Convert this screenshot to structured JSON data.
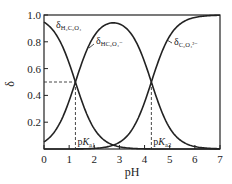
{
  "chart_data": {
    "type": "line",
    "title": "",
    "xlabel": "pH",
    "ylabel": "δ",
    "xlim": [
      0,
      7
    ],
    "ylim": [
      0,
      1.0
    ],
    "xticks": [
      "0",
      "1",
      "2",
      "3",
      "4",
      "5",
      "6",
      "7"
    ],
    "yticks": [
      "0.2",
      "0.4",
      "0.6",
      "0.8",
      "1.0"
    ],
    "grid": false,
    "pKa1": 1.25,
    "pKa2": 4.27,
    "annotations": {
      "pKa1_label": "pK",
      "pKa1_sub": "a1",
      "pKa2_label": "pK",
      "pKa2_sub": "a2",
      "half_line_y": 0.5
    },
    "series": [
      {
        "name": "δ_H2C2O4",
        "label_main": "δ",
        "label_sub": "H₂C₂O₄",
        "x": [
          0,
          0.5,
          1,
          1.25,
          1.5,
          2,
          2.5,
          3,
          3.5,
          4,
          5,
          6,
          7
        ],
        "values": [
          0.95,
          0.85,
          0.64,
          0.5,
          0.36,
          0.15,
          0.05,
          0.02,
          0.005,
          0.001,
          0,
          0,
          0
        ]
      },
      {
        "name": "δ_HC2O4-",
        "label_main": "δ",
        "label_sub": "HC₂O₄⁻",
        "x": [
          0,
          0.5,
          1,
          1.25,
          1.5,
          2,
          2.5,
          3,
          3.5,
          4,
          4.27,
          4.5,
          5,
          5.5,
          6,
          7
        ],
        "values": [
          0.05,
          0.15,
          0.36,
          0.5,
          0.63,
          0.83,
          0.91,
          0.92,
          0.85,
          0.65,
          0.5,
          0.37,
          0.16,
          0.06,
          0.02,
          0
        ]
      },
      {
        "name": "δ_C2O4 2-",
        "label_main": "δ",
        "label_sub": "C₂O₄²⁻",
        "x": [
          0,
          1,
          2,
          2.5,
          3,
          3.5,
          4,
          4.27,
          4.5,
          5,
          5.5,
          6,
          6.5,
          7
        ],
        "values": [
          0,
          0,
          0.01,
          0.03,
          0.06,
          0.14,
          0.35,
          0.5,
          0.63,
          0.84,
          0.94,
          0.98,
          0.99,
          1.0
        ]
      }
    ]
  }
}
